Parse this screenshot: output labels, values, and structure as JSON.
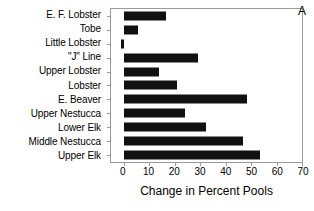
{
  "chart_data": {
    "type": "bar",
    "orientation": "horizontal",
    "title": "",
    "panel_label": "A",
    "xlabel": "Change in Percent Pools",
    "ylabel": "",
    "xlim": [
      -5,
      70
    ],
    "axis_min": -5,
    "axis_max": 70,
    "xticks": [
      0,
      10,
      20,
      30,
      40,
      50,
      60,
      70
    ],
    "xticklabels": [
      "0",
      "10",
      "20",
      "30",
      "40",
      "50",
      "60",
      "70"
    ],
    "grid": false,
    "legend": null,
    "bar_color": "#111111",
    "axis_color": "#9a9a9a",
    "categories": [
      "E. F. Lobster",
      "Tobe",
      "Little Lobster",
      "\"J\" Line",
      "Upper Lobster",
      "Lobster",
      "E. Beaver",
      "Upper Nestucca",
      "Lower Elk",
      "Middle Nestucca",
      "Upper Elk"
    ],
    "values": [
      16.5,
      5.5,
      -1.0,
      29.0,
      14.0,
      21.0,
      48.5,
      24.0,
      32.5,
      47.0,
      53.5
    ]
  }
}
